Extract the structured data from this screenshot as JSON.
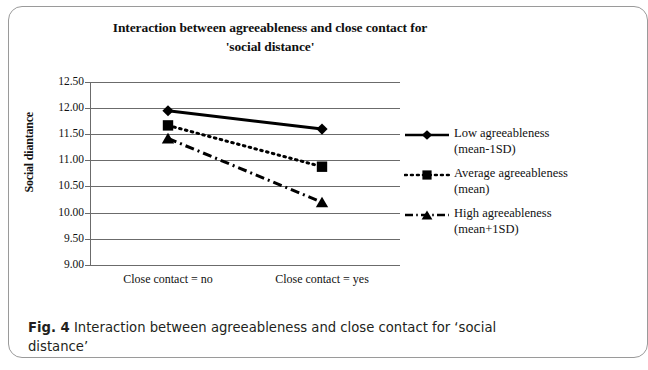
{
  "figure": {
    "caption_label": "Fig. 4",
    "caption_text": " Interaction between agreeableness and close contact for ‘social distance’"
  },
  "chart_data": {
    "type": "line",
    "title": "Interaction between agreeableness and close contact for",
    "title_line2": "'social distance'",
    "xlabel": "",
    "ylabel": "Social diantance",
    "categories": [
      "Close contact = no",
      "Close contact = yes"
    ],
    "ylim": [
      9.0,
      12.5
    ],
    "yticks": [
      "12.50",
      "12.00",
      "11.50",
      "11.00",
      "10.50",
      "10.00",
      "9.50",
      "9.00"
    ],
    "ytick_values": [
      12.5,
      12.0,
      11.5,
      11.0,
      10.5,
      10.0,
      9.5,
      9.0
    ],
    "grid": true,
    "legend_position": "right",
    "series": [
      {
        "name": "Low agreeableness",
        "name_sub": "(mean-1SD)",
        "marker": "diamond",
        "line_style": "solid",
        "values": [
          11.95,
          11.6
        ]
      },
      {
        "name": "Average agreeableness",
        "name_sub": "(mean)",
        "marker": "square",
        "line_style": "dotted",
        "values": [
          11.67,
          10.88
        ]
      },
      {
        "name": "High agreeableness",
        "name_sub": "(mean+1SD)",
        "marker": "triangle",
        "line_style": "dash-dot",
        "values": [
          11.42,
          10.2
        ]
      }
    ],
    "colors": {
      "ink": "#000000",
      "grid": "#6b6b6b",
      "background": "#ffffff"
    }
  }
}
